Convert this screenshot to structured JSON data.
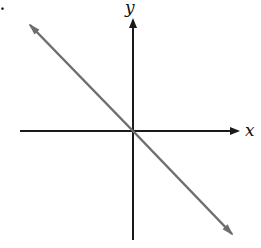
{
  "figure": {
    "part_marker": ".",
    "axes": {
      "x_label": "x",
      "y_label": "y",
      "axis_color": "#1a1a1a"
    },
    "line": {
      "description": "straight line through origin with negative slope (y = -x)",
      "color": "#6e6e6e",
      "direction": "both ends arrowed"
    }
  }
}
